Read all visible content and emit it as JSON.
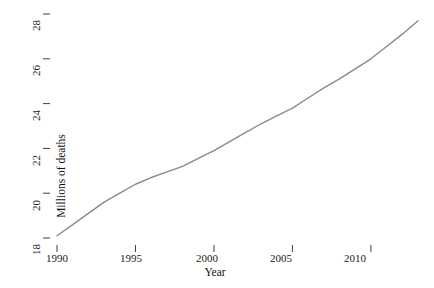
{
  "chart_data": {
    "type": "line",
    "title": "",
    "subtitle": "",
    "xlabel": "Year",
    "ylabel": "Millions of deaths",
    "xlim": [
      1989.2,
      2013.6
    ],
    "ylim": [
      17.6,
      28.3
    ],
    "xticks": [
      1990,
      1995,
      2000,
      2005,
      2010
    ],
    "yticks": [
      18,
      20,
      22,
      24,
      26,
      28
    ],
    "xtick_labels": [
      "1990",
      "1995",
      "2000",
      "2005",
      "2010"
    ],
    "ytick_labels": [
      "18",
      "20",
      "22",
      "24",
      "26",
      "28"
    ],
    "grid": false,
    "legend": null,
    "legend_position": "none",
    "annotations": [],
    "series": [
      {
        "name": "Millions of deaths",
        "color": "#8a8a8a",
        "line_width": 1.4,
        "markers": false,
        "x": [
          1990,
          1991,
          1992,
          1993,
          1994,
          1995,
          1996,
          1997,
          1998,
          1999,
          2000,
          2001,
          2002,
          2003,
          2004,
          2005,
          2006,
          2007,
          2008,
          2009,
          2010,
          2011,
          2012,
          2013
        ],
        "y": [
          18.1,
          18.6,
          19.1,
          19.6,
          20.0,
          20.4,
          20.7,
          20.95,
          21.2,
          21.55,
          21.9,
          22.3,
          22.7,
          23.1,
          23.45,
          23.8,
          24.25,
          24.7,
          25.1,
          25.55,
          26.0,
          26.55,
          27.1,
          27.7
        ]
      }
    ]
  },
  "axes": {
    "y_title": "Millions of deaths",
    "x_title": "Year"
  }
}
